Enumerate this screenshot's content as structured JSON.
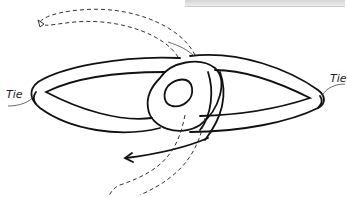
{
  "diagram": {
    "type": "knot-illustration",
    "labels": {
      "left_tie": "Tie",
      "right_tie": "Tie"
    },
    "colors": {
      "rope_outline": "#111111",
      "background": "#ffffff",
      "dashed_path": "#333333"
    }
  }
}
